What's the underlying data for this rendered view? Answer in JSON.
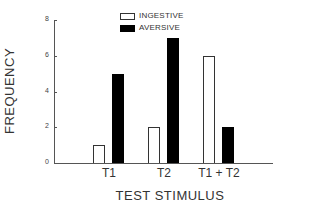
{
  "chart_data": {
    "type": "bar",
    "title": "",
    "xlabel": "TEST STIMULUS",
    "ylabel": "FREQUENCY",
    "categories": [
      "T1",
      "T2",
      "T1 + T2"
    ],
    "series": [
      {
        "name": "INGESTIVE",
        "values": [
          1,
          2,
          6
        ],
        "fill": "#ffffff",
        "stroke": "#333333"
      },
      {
        "name": "AVERSIVE",
        "values": [
          5,
          7,
          2
        ],
        "fill": "#000000",
        "stroke": "#000000"
      }
    ],
    "ylim": [
      0,
      8
    ],
    "yticks": [
      0,
      2,
      4,
      6,
      8
    ],
    "grid": false,
    "legend_position": "top-right"
  },
  "labels": {
    "ylabel": "FREQUENCY",
    "xlabel": "TEST STIMULUS",
    "yticks": [
      "0",
      "2",
      "4",
      "6",
      "8"
    ],
    "categories": [
      "T1",
      "T2",
      "T1 + T2"
    ],
    "legend": [
      "INGESTIVE",
      "AVERSIVE"
    ]
  }
}
